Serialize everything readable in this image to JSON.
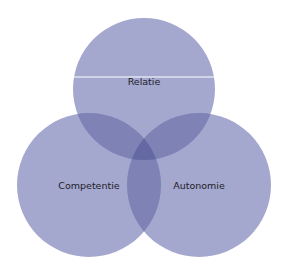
{
  "diagram": {
    "type": "venn",
    "fill_color": "#8c90c2",
    "fill_opacity": 0.82,
    "circles": [
      {
        "label": "Relatie",
        "cx": 144,
        "cy": 89,
        "r": 71
      },
      {
        "label": "Competentie",
        "cx": 89,
        "cy": 185,
        "r": 72
      },
      {
        "label": "Autonomie",
        "cx": 199,
        "cy": 185,
        "r": 72
      }
    ],
    "divider_line": {
      "y": 77,
      "x1": 74,
      "x2": 214,
      "color": "#ffffff"
    }
  }
}
